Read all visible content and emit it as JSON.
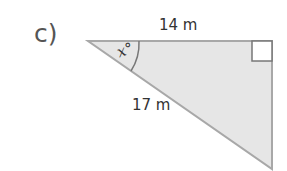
{
  "question": {
    "label": "c)"
  },
  "triangle": {
    "top_side": "14 m",
    "hypotenuse": "17 m",
    "angle_label": "x°",
    "right_angle_marker": true,
    "fill_color": "#e6e6e6",
    "stroke_color": "#a8a8a8"
  }
}
